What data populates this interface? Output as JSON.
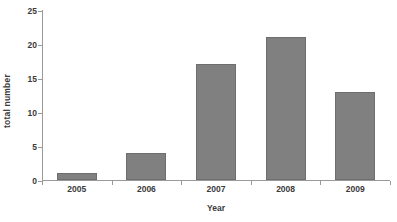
{
  "chart_data": {
    "type": "bar",
    "title": "",
    "subtitle": "",
    "categories": [
      "2005",
      "2006",
      "2007",
      "2008",
      "2009"
    ],
    "values": [
      1,
      4,
      17,
      21,
      13
    ],
    "xlabel": "Year",
    "ylabel": "total number",
    "ylim": [
      0,
      25
    ],
    "yticks": [
      0,
      5,
      10,
      15,
      20,
      25
    ],
    "yticklabels": [
      "0",
      "5",
      "10",
      "15",
      "20",
      "25"
    ],
    "grid": false,
    "legend": null,
    "legend_position": "none",
    "series": [
      {
        "name": "total number",
        "values": [
          1,
          4,
          17,
          21,
          13
        ]
      }
    ],
    "annotations": [],
    "colors": {
      "bar_fill": "#808080",
      "bar_edge": "#6e6e6e",
      "axis": "#9a9a9a",
      "text": "#3b3b3b",
      "background": "#ffffff"
    }
  }
}
